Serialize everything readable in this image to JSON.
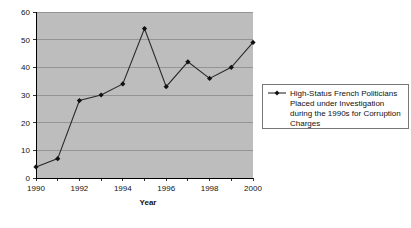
{
  "chart_data": {
    "type": "line",
    "title": "",
    "xlabel": "Year",
    "ylabel": "",
    "x": [
      1990,
      1991,
      1992,
      1993,
      1994,
      1995,
      1996,
      1997,
      1998,
      1999,
      2000
    ],
    "values": [
      4,
      7,
      28,
      30,
      34,
      54,
      33,
      42,
      36,
      40,
      49
    ],
    "series": [
      {
        "name": "High-Status French Politicians Placed under Investigation during the 1990s for Corruption Charges",
        "values": [
          4,
          7,
          28,
          30,
          34,
          54,
          33,
          42,
          36,
          40,
          49
        ]
      }
    ],
    "xlim": [
      1990,
      2000
    ],
    "ylim": [
      0,
      60
    ],
    "y_ticks": [
      0,
      10,
      20,
      30,
      40,
      50,
      60
    ],
    "y_tick_labels": [
      "0",
      "10",
      "20",
      "30",
      "40",
      "50",
      "60"
    ],
    "x_ticks": [
      1990,
      1991,
      1992,
      1993,
      1994,
      1995,
      1996,
      1997,
      1998,
      1999,
      2000
    ],
    "x_tick_labels": [
      "1990",
      "",
      "1992",
      "",
      "1994",
      "",
      "1996",
      "",
      "1998",
      "",
      "2000"
    ],
    "grid": true,
    "grid_axis": "y",
    "legend_position": "right",
    "plot_background_color": "#bdbdbd",
    "series_color": "#2a2a2a",
    "marker": "diamond"
  },
  "legend": {
    "entries": [
      {
        "label_lines": [
          "High-Status French Politicians",
          "Placed under Investigation",
          "during the 1990s for Corruption",
          "Charges"
        ]
      }
    ]
  },
  "axes": {
    "x_title": "Year"
  }
}
